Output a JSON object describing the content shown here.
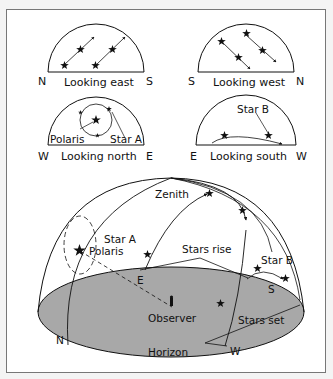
{
  "panels": {
    "east": {
      "title": "Looking east",
      "left": "N",
      "right": "S"
    },
    "west": {
      "title": "Looking west",
      "left": "S",
      "right": "N"
    },
    "north": {
      "title": "Looking north",
      "left": "W",
      "right": "E",
      "label_polaris": "Polaris",
      "label_star": "Star A"
    },
    "south": {
      "title": "Looking south",
      "left": "E",
      "right": "W",
      "label_star": "Star B"
    }
  },
  "main": {
    "zenith": "Zenith",
    "star_a": "Star A",
    "polaris": "Polaris",
    "stars_rise": "Stars rise",
    "stars_set": "Stars set",
    "star_b": "Star B",
    "observer": "Observer",
    "horizon": "Horizon",
    "dir_n": "N",
    "dir_e": "E",
    "dir_s": "S",
    "dir_w": "W"
  },
  "colors": {
    "ground": "#a8a8a8",
    "line": "#111111",
    "frame": "#777777"
  }
}
